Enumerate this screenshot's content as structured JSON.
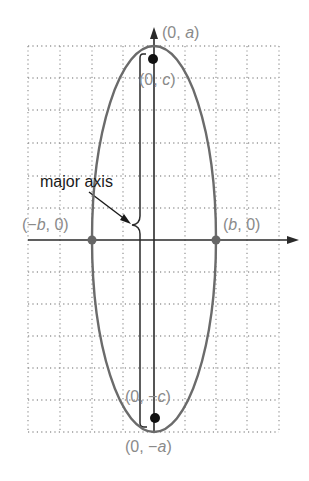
{
  "diagram": {
    "type": "vertical ellipse with foci",
    "labels": {
      "top_vertex": "(0, a)",
      "top_vertex_parts": [
        "(0, ",
        "a",
        ")"
      ],
      "bottom_vertex": "(0, −a)",
      "bottom_vertex_parts": [
        "(0, −",
        "a",
        ")"
      ],
      "top_focus": "(0, c)",
      "top_focus_parts": [
        "(0, ",
        "c",
        ")"
      ],
      "bottom_focus": "(0, −c)",
      "bottom_focus_parts": [
        "(0, −",
        "c",
        ")"
      ],
      "left_covertex": "(−b, 0)",
      "left_covertex_parts": [
        "(−",
        "b",
        ", 0)"
      ],
      "right_covertex": "(b, 0)",
      "right_covertex_parts": [
        "(",
        "b",
        ", 0)"
      ],
      "annotation": "major axis"
    },
    "points": [
      {
        "name": "top-vertex",
        "label": "(0, a)"
      },
      {
        "name": "top-focus",
        "label": "(0, c)"
      },
      {
        "name": "bottom-focus",
        "label": "(0, −c)"
      },
      {
        "name": "bottom-vertex",
        "label": "(0, −a)"
      },
      {
        "name": "left-covertex",
        "label": "(−b, 0)"
      },
      {
        "name": "right-covertex",
        "label": "(b, 0)"
      }
    ],
    "grid": {
      "columns": 8,
      "rows": 12,
      "style": "dotted"
    },
    "colors": {
      "ellipse": "#6b6b6b",
      "axis": "#2a2a2a",
      "grid": "#9a9a9a",
      "label": "#8a8a8a",
      "annotation": "#1a1a1a",
      "focus_dot": "#111111",
      "covertex_dot": "#666666"
    }
  }
}
